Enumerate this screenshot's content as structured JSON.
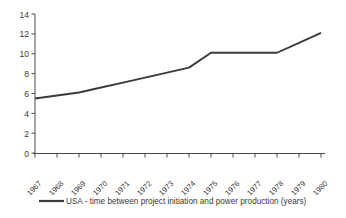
{
  "chart_data": {
    "type": "line",
    "title": "",
    "subtitle": "",
    "xlabel": "",
    "ylabel": "",
    "categories": [
      "1967",
      "1968",
      "1969",
      "1970",
      "1971",
      "1972",
      "1973",
      "1974",
      "1975",
      "1976",
      "1977",
      "1978",
      "1979",
      "1980"
    ],
    "series": [
      {
        "name": "USA - time between project initiation and power production (years)",
        "values": [
          5.5,
          5.8,
          6.1,
          6.6,
          7.1,
          7.6,
          8.1,
          8.6,
          10.1,
          10.1,
          10.1,
          10.1,
          11.1,
          12.1
        ],
        "color": "#3b3b3b"
      }
    ],
    "ylim": [
      0,
      14
    ],
    "ytick_values": [
      0,
      2,
      4,
      6,
      8,
      10,
      12,
      14
    ],
    "ytick_labels": [
      "0",
      "2",
      "4",
      "6",
      "8",
      "10",
      "12",
      "14"
    ],
    "grid": false,
    "legend_position": "bottom",
    "legend": [
      {
        "label": "USA - time between project initiation and power production (years)",
        "color": "#3b3b3b"
      }
    ],
    "annotations": [],
    "axis_color": "#4a4a4a",
    "background_color": "#ffffff"
  }
}
